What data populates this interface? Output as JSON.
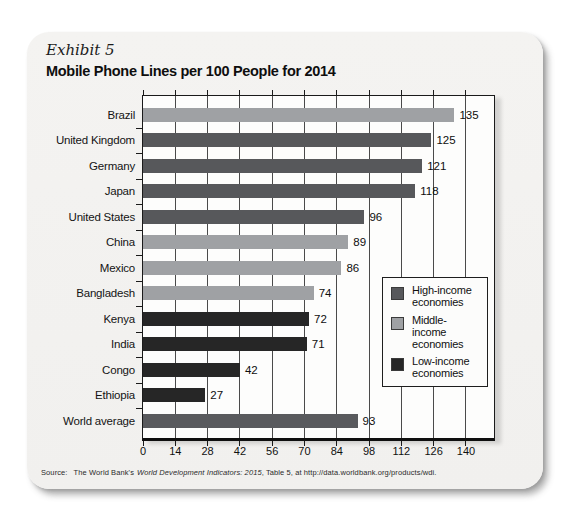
{
  "card": {
    "exhibit_label": "Exhibit 5",
    "title": "Mobile Phone Lines per 100 People for 2014",
    "background": "#f3f2f0"
  },
  "legend": {
    "items": [
      {
        "line1": "High-income",
        "line2": "economies",
        "color": "#57585b"
      },
      {
        "line1": "Middle-income",
        "line2": "economies",
        "color": "#9fa1a4"
      },
      {
        "line1": "Low-income",
        "line2": "economies",
        "color": "#262626"
      }
    ]
  },
  "source": {
    "prefix": "Source:",
    "before_italic": "The World Bank's",
    "italic": "World Development Indicators: 2015",
    "after_italic": ", Table 5, at http://data.worldbank.org/products/wdi."
  },
  "chart_data": {
    "type": "bar",
    "orientation": "horizontal",
    "title": "Mobile Phone Lines per 100 People for 2014",
    "xlabel": "",
    "ylabel": "",
    "xlim": [
      0,
      152
    ],
    "x_ticks": [
      0,
      14,
      28,
      42,
      56,
      70,
      84,
      98,
      112,
      126,
      140
    ],
    "grid": "vertical",
    "legend_position": "inside-right",
    "categories": [
      "Brazil",
      "United Kingdom",
      "Germany",
      "Japan",
      "United States",
      "China",
      "Mexico",
      "Bangladesh",
      "Kenya",
      "India",
      "Congo",
      "Ethiopia",
      "World average"
    ],
    "values": [
      135,
      125,
      121,
      118,
      96,
      89,
      86,
      74,
      72,
      71,
      42,
      27,
      93
    ],
    "income_group": [
      "middle",
      "high",
      "high",
      "high",
      "high",
      "middle",
      "middle",
      "middle",
      "low",
      "low",
      "low",
      "low",
      "world"
    ],
    "colors": {
      "high": "#57585b",
      "middle": "#9fa1a4",
      "low": "#262626",
      "world": "#595a5d"
    }
  }
}
